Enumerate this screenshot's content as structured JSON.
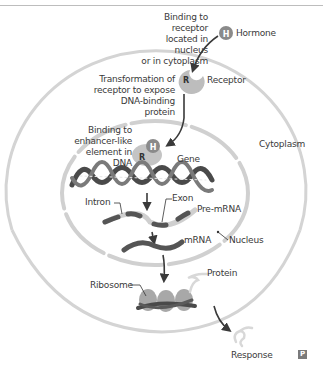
{
  "diagram": {
    "type": "biology-process",
    "labels": {
      "binding_receptor": "Binding to receptor\nlocated in nucleus\nor in cytoplasm",
      "hormone": "Hormone",
      "hormone_glyph": "H",
      "receptor": "Receptor",
      "receptor_glyph": "R",
      "transformation": "Transformation of\nreceptor to expose\nDNA-binding protein",
      "binding_enhancer": "Binding to\nenhancer-like\nelement in DNA",
      "gene": "Gene",
      "cytoplasm": "Cytoplasm",
      "intron": "Intron",
      "exon": "Exon",
      "pre_mrna": "Pre-mRNA",
      "mrna": "mRNA",
      "nucleus": "Nucleus",
      "protein": "Protein",
      "ribosome": "Ribosome",
      "response": "Response",
      "corner_badge": "P"
    },
    "colors": {
      "membrane": "#d4d4d4",
      "hormone": "#8a8a8a",
      "receptor": "#bdbdbd",
      "dna": "#4a4a4a",
      "exon": "#555555",
      "intron": "#cfcfcf",
      "arrow": "#3a3a3a",
      "ribosome": "#a8a8a8",
      "protein": "#d8d8d8"
    }
  }
}
